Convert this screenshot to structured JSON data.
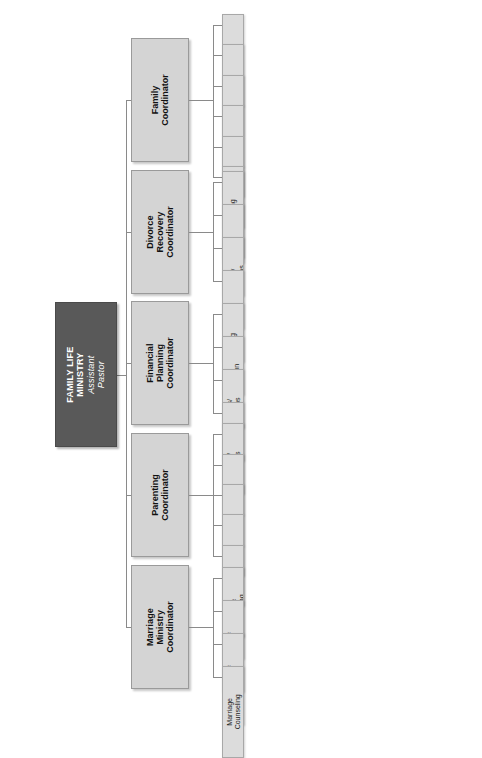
{
  "diagram": {
    "type": "organizational-chart",
    "orientation": "horizontal-rotated",
    "colors": {
      "root_fill": "#595959",
      "root_text": "#ffffff",
      "coordinator_fill": "#d4d4d4",
      "leaf_fill": "#dcdcdc",
      "connector": "#8a8a8a",
      "background": "#ffffff"
    },
    "root": {
      "title": "FAMILY LIFE MINISTRY",
      "subtitle": "Assistant Pastor"
    },
    "branches": [
      {
        "id": "family",
        "label": "Family Coordinator",
        "children": [
          {
            "label": "Crisis Manager"
          },
          {
            "label": "Marriage Advisor"
          },
          {
            "label": "Family Advisor"
          },
          {
            "label": "Adult"
          },
          {
            "label": "Youth"
          },
          {
            "label": "Children"
          }
        ]
      },
      {
        "id": "divorce-recovery",
        "label": "Divorce Recovery Coordinator",
        "children": [
          {
            "label": "Counseling"
          },
          {
            "label": "Classes"
          },
          {
            "label": "Special Seminar/ Workshops"
          },
          {
            "label": "Blended Families"
          }
        ]
      },
      {
        "id": "financial-planning",
        "label": "Financial Planning Coordinator",
        "children": [
          {
            "label": "Budgeting"
          },
          {
            "label": "Tax Preparation"
          },
          {
            "label": "Seminars/ Workshops"
          },
          {
            "label": "Investments"
          }
        ]
      },
      {
        "id": "parenting",
        "label": "Parenting Coordinator",
        "children": [
          {
            "label": "Seminars/ Workshops"
          },
          {
            "label": "Spiritual Growth Classes"
          },
          {
            "label": "C.B.S. (Center for Biblical Studies)"
          },
          {
            "label": "Blended Families"
          },
          {
            "label": "Single Parents"
          }
        ]
      },
      {
        "id": "marriage-ministry",
        "label": "Marriage Ministry Coordinator",
        "children": [
          {
            "label": "Pre-Marriage Counselling"
          },
          {
            "label": "Marriage Retreat"
          },
          {
            "label": "Marriage Classes"
          },
          {
            "label": "Marriage Counseling"
          }
        ]
      }
    ]
  }
}
